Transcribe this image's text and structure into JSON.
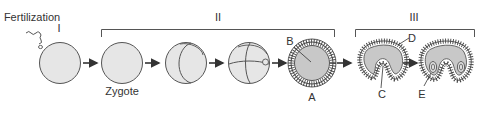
{
  "diagram": {
    "stage_labels": {
      "fertilization": "Fertilization",
      "stage_one": "I",
      "stage_two": "II",
      "stage_three": "III",
      "zygote": "Zygote"
    },
    "part_labels": {
      "a": "A",
      "b": "B",
      "c": "C",
      "d": "D",
      "e": "E"
    },
    "sequence": [
      {
        "name": "fertilized-egg",
        "label": "I"
      },
      {
        "name": "zygote",
        "label": "Zygote"
      },
      {
        "name": "two-cell-cleavage",
        "label": ""
      },
      {
        "name": "multi-cell-cleavage",
        "label": ""
      },
      {
        "name": "blastula",
        "label": "A"
      },
      {
        "name": "early-gastrula",
        "label": ""
      },
      {
        "name": "late-gastrula",
        "label": ""
      }
    ],
    "colors": {
      "cell_fill": "#e6e6e6",
      "inner_fill": "#c8c8c8",
      "stroke": "#555555",
      "text": "#333333"
    }
  }
}
